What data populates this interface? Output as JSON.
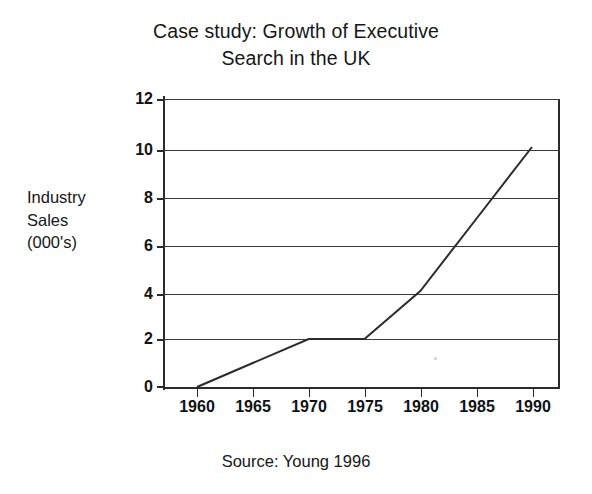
{
  "chart_data": {
    "type": "line",
    "title": "Case study: Growth of Executive Search in the UK",
    "title_lines": [
      "Case study: Growth of Executive",
      "Search in the UK"
    ],
    "xlabel": "",
    "ylabel": "Industry Sales (000's)",
    "ylabel_lines": [
      "Industry",
      "Sales",
      "(000's)"
    ],
    "source": "Source: Young 1996",
    "x": [
      1960,
      1965,
      1970,
      1975,
      1980,
      1985,
      1990
    ],
    "categories": [
      "1960",
      "1965",
      "1970",
      "1975",
      "1980",
      "1985",
      "1990"
    ],
    "values": [
      0,
      1,
      2,
      2,
      4,
      7,
      10
    ],
    "series": [
      {
        "name": "Industry Sales (000's)",
        "values": [
          0,
          1,
          2,
          2,
          4,
          7,
          10
        ]
      }
    ],
    "ylim": [
      0,
      12
    ],
    "xlim": [
      1960,
      1990
    ],
    "y_ticks": [
      0,
      2,
      4,
      6,
      8,
      10,
      12
    ],
    "y_tick_labels": [
      "0",
      "2",
      "4",
      "6",
      "8",
      "10",
      "12"
    ],
    "x_ticks": [
      1960,
      1965,
      1970,
      1975,
      1980,
      1985,
      1990
    ],
    "grid": "horizontal",
    "legend": "none",
    "line_color": "#2b2b2b"
  },
  "colors": {
    "background": "#ffffff",
    "ink": "#161616",
    "axis": "#2b2b2b",
    "grid": "#3a3a3a"
  },
  "labels": {
    "title_line_1": "Case study: Growth of Executive",
    "title_line_2": "Search in the UK",
    "y_caption_line_1": "Industry",
    "y_caption_line_2": "Sales",
    "y_caption_line_3": "(000's)",
    "source": "Source: Young 1996",
    "y0": "0",
    "y2": "2",
    "y4": "4",
    "y6": "6",
    "y8": "8",
    "y10": "10",
    "y12": "12",
    "x1960": "1960",
    "x1965": "1965",
    "x1970": "1970",
    "x1975": "1975",
    "x1980": "1980",
    "x1985": "1985",
    "x1990": "1990"
  }
}
